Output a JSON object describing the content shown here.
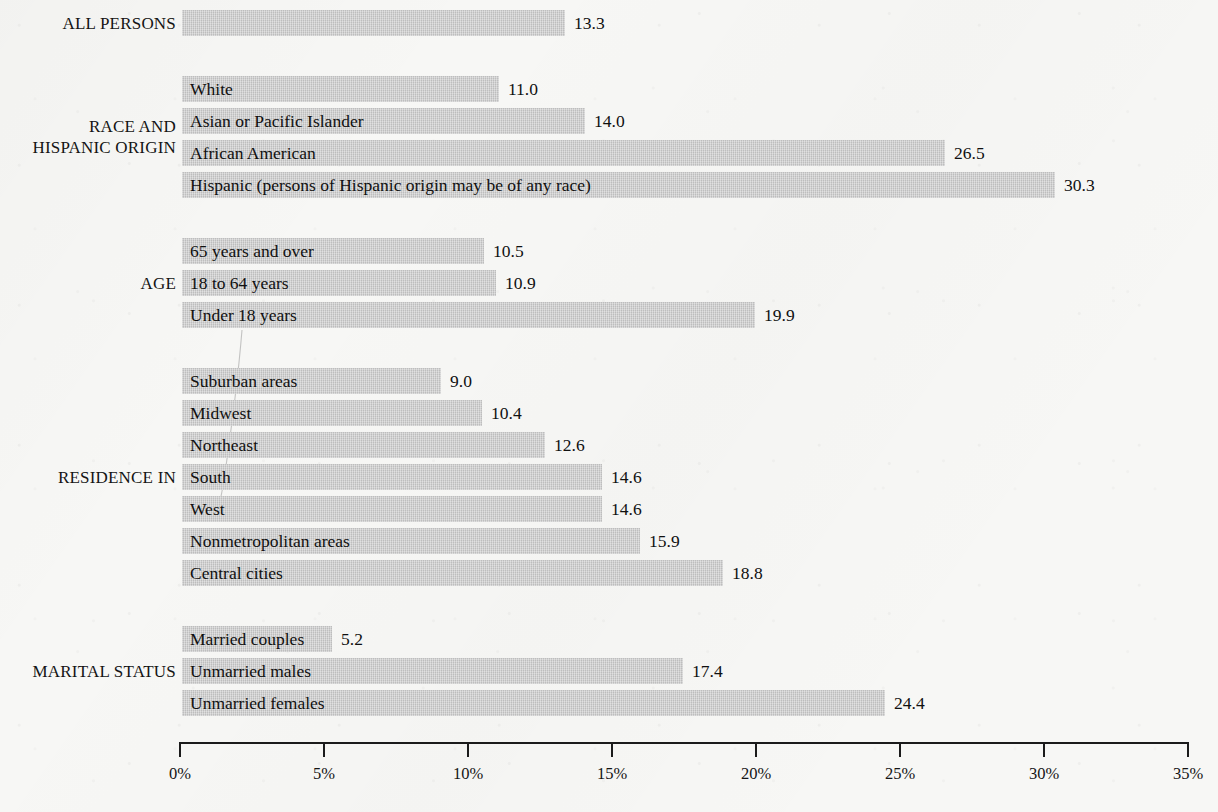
{
  "chart_data": {
    "type": "bar",
    "orientation": "horizontal",
    "title": "",
    "xlabel": "",
    "ylabel": "",
    "xlim": [
      0,
      35
    ],
    "grid": false,
    "legend": null,
    "axis": {
      "tick_labels": [
        "0%",
        "5%",
        "10%",
        "15%",
        "20%",
        "25%",
        "30%",
        "35%"
      ],
      "tick_values": [
        0,
        5,
        10,
        15,
        20,
        25,
        30,
        35
      ]
    },
    "value_suffix": "",
    "groups": [
      {
        "name": "ALL PERSONS",
        "label_lines": "ALL PERSONS",
        "bars": [
          {
            "label": "",
            "value": 13.3,
            "value_text": "13.3"
          }
        ]
      },
      {
        "name": "RACE AND HISPANIC ORIGIN",
        "label_lines": "RACE AND\nHISPANIC ORIGIN",
        "bars": [
          {
            "label": "White",
            "value": 11.0,
            "value_text": "11.0"
          },
          {
            "label": "Asian or Pacific Islander",
            "value": 14.0,
            "value_text": "14.0"
          },
          {
            "label": "African American",
            "value": 26.5,
            "value_text": "26.5"
          },
          {
            "label": "Hispanic (persons of Hispanic origin may be of any race)",
            "value": 30.3,
            "value_text": "30.3"
          }
        ]
      },
      {
        "name": "AGE",
        "label_lines": "AGE",
        "bars": [
          {
            "label": "65 years and over",
            "value": 10.5,
            "value_text": "10.5"
          },
          {
            "label": "18 to 64 years",
            "value": 10.9,
            "value_text": "10.9"
          },
          {
            "label": "Under 18 years",
            "value": 19.9,
            "value_text": "19.9"
          }
        ]
      },
      {
        "name": "RESIDENCE IN",
        "label_lines": "RESIDENCE IN",
        "bars": [
          {
            "label": "Suburban areas",
            "value": 9.0,
            "value_text": "9.0"
          },
          {
            "label": "Midwest",
            "value": 10.4,
            "value_text": "10.4"
          },
          {
            "label": "Northeast",
            "value": 12.6,
            "value_text": "12.6"
          },
          {
            "label": "South",
            "value": 14.6,
            "value_text": "14.6"
          },
          {
            "label": "West",
            "value": 14.6,
            "value_text": "14.6"
          },
          {
            "label": "Nonmetropolitan areas",
            "value": 15.9,
            "value_text": "15.9"
          },
          {
            "label": "Central cities",
            "value": 18.8,
            "value_text": "18.8"
          }
        ]
      },
      {
        "name": "MARITAL STATUS",
        "label_lines": "MARITAL STATUS",
        "bars": [
          {
            "label": "Married couples",
            "value": 5.2,
            "value_text": "5.2"
          },
          {
            "label": "Unmarried males",
            "value": 17.4,
            "value_text": "17.4"
          },
          {
            "label": "Unmarried females",
            "value": 24.4,
            "value_text": "24.4"
          }
        ]
      }
    ]
  },
  "colors": {
    "bar_fill": "#c4c4c4",
    "paper": "#f7f7f5",
    "ink": "#141414",
    "axis": "#1b1b1b"
  },
  "layout": {
    "plot_left_px": 182,
    "axis_left_px": 179,
    "axis_right_px": 1187,
    "px_per_percent": 28.8,
    "bar_height_px": 26,
    "row_pitch_px": 32,
    "group_gap_px": 34,
    "first_row_top_px": 10,
    "axis_y_px": 742
  }
}
